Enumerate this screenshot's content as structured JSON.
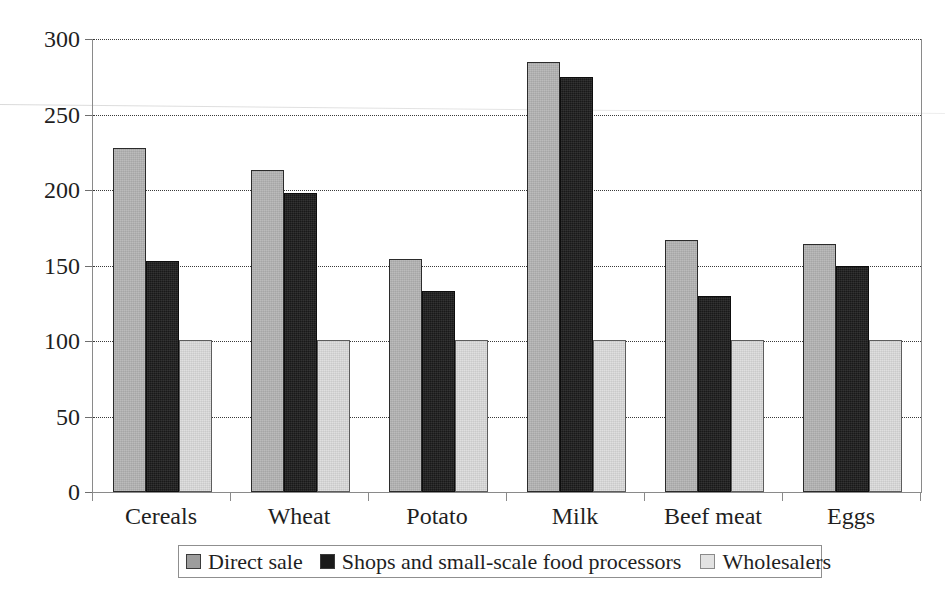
{
  "chart_data": {
    "type": "bar",
    "title": "",
    "subtitle": "",
    "xlabel": "",
    "ylabel": "",
    "ylim": [
      0,
      300
    ],
    "ytick_values": [
      0,
      50,
      100,
      150,
      200,
      250,
      300
    ],
    "ytick_labels": [
      "0",
      "50",
      "100",
      "150",
      "200",
      "250",
      "300"
    ],
    "grid": "horizontal-dotted",
    "legend_position": "bottom",
    "categories": [
      "Cereals",
      "Wheat",
      "Potato",
      "Milk",
      "Beef meat",
      "Eggs"
    ],
    "series": [
      {
        "name": "Direct sale",
        "color": "#b4b4b4",
        "values": [
          228,
          213,
          154,
          285,
          167,
          164
        ]
      },
      {
        "name": "Shops and small-scale food processors",
        "color": "#1b1b1b",
        "values": [
          153,
          198,
          133,
          275,
          130,
          150
        ]
      },
      {
        "name": "Wholesalers",
        "color": "#dcdcdc",
        "values": [
          101,
          101,
          101,
          101,
          101,
          101
        ]
      }
    ]
  },
  "legend": {
    "entries": [
      {
        "label": "Direct sale",
        "swatch": "legend-swatch-direct-sale"
      },
      {
        "label": "Shops and small-scale food processors",
        "swatch": "legend-swatch-shops"
      },
      {
        "label": "Wholesalers",
        "swatch": "legend-swatch-wholesalers"
      }
    ]
  },
  "axis": {
    "y_labels": [
      "300",
      "250",
      "200",
      "150",
      "100",
      "50",
      "0"
    ],
    "x_labels": [
      "Cereals",
      "Wheat",
      "Potato",
      "Milk",
      "Beef meat",
      "Eggs"
    ]
  }
}
